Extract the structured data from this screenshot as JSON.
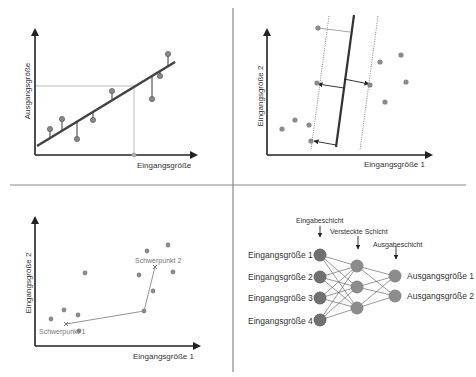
{
  "colors": {
    "axis": "#222222",
    "regression_line": "#444444",
    "guide_line": "#999999",
    "point": "#8a8a8a",
    "point_dark": "#555555",
    "divider": "#888888",
    "input_node": "#707070",
    "hidden_node": "#8c8c8c",
    "output_node": "#8c8c8c",
    "edge": "#555555"
  },
  "panels": {
    "regression": {
      "title": "Lineare Regression",
      "ylabel": "Ausgangsgröße",
      "xlabel": "Eingangsgröße"
    },
    "svm": {
      "title": "Support Vector Machine",
      "ylabel": "Eingangsgröße 2",
      "xlabel": "Eingangsgröße 1"
    },
    "clustering": {
      "title": "k-Means Clustering",
      "ylabel": "Eingangsgröße 2",
      "xlabel": "Eingangsgröße 1",
      "centroid1_label": "Schwerpunkt 1",
      "centroid2_label": "Schwerpunkt 2"
    },
    "neural_network": {
      "title": "Neuronales Netz",
      "input_layer_label": "Eingabeschicht",
      "hidden_layer_label": "Versteckte Schicht",
      "output_layer_label": "Ausgabeschicht",
      "inputs": [
        "Eingangsgröße 1",
        "Eingangsgröße 2",
        "Eingangsgröße 3",
        "Eingangsgröße 4"
      ],
      "outputs": [
        "Ausgangsgröße 1",
        "Ausgangsgröße 2"
      ],
      "hidden_count": 3
    }
  }
}
